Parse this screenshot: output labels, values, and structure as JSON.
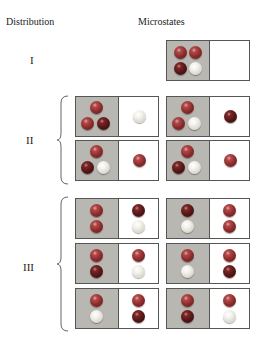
{
  "headers": {
    "distribution": "Distribution",
    "microstates": "Microstates"
  },
  "colors": {
    "gray_box": "#b9b7b1",
    "white_box": "#ffffff",
    "ball_red": "#8a2a2a",
    "ball_dark_red": "#521616",
    "ball_white": "#e8e6df"
  },
  "distributions": [
    {
      "label": "I",
      "microstates": [
        {
          "left": [
            "red",
            "red",
            "dark",
            "white"
          ],
          "right": []
        }
      ]
    },
    {
      "label": "II",
      "microstates": [
        {
          "left": [
            "red",
            "red",
            "dark"
          ],
          "right": [
            "white"
          ]
        },
        {
          "left": [
            "red",
            "red",
            "dark"
          ],
          "right": [
            "dark"
          ]
        },
        {
          "left": [
            "red",
            "dark",
            "white"
          ],
          "right": [
            "red"
          ]
        },
        {
          "left": [
            "red",
            "dark",
            "white"
          ],
          "right": [
            "red"
          ]
        }
      ]
    },
    {
      "label": "III",
      "microstates": [
        {
          "left": [
            "red",
            "red"
          ],
          "right": [
            "dark",
            "white"
          ]
        },
        {
          "left": [
            "dark",
            "white"
          ],
          "right": [
            "red",
            "red"
          ]
        },
        {
          "left": [
            "red",
            "dark"
          ],
          "right": [
            "red",
            "white"
          ]
        },
        {
          "left": [
            "red",
            "white"
          ],
          "right": [
            "red",
            "dark"
          ]
        },
        {
          "left": [
            "red",
            "white"
          ],
          "right": [
            "red",
            "dark"
          ]
        },
        {
          "left": [
            "red",
            "dark"
          ],
          "right": [
            "red",
            "white"
          ]
        }
      ]
    }
  ]
}
